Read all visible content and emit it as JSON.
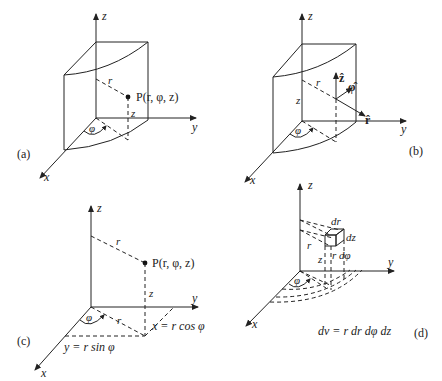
{
  "figure": {
    "panels": [
      {
        "id": "a",
        "label": "(a)",
        "axes": {
          "x": "x",
          "y": "y",
          "z": "z"
        },
        "point_label": "P(r, φ, z)",
        "r_label": "r",
        "z_label": "z",
        "phi_label": "φ"
      },
      {
        "id": "b",
        "label": "(b)",
        "axes": {
          "x": "x",
          "y": "y",
          "z": "z"
        },
        "r_label": "r",
        "z_label": "z",
        "phi_label": "φ",
        "unit_vectors": {
          "z_hat": "ẑ",
          "phi_hat": "φ̂",
          "r_hat": "r̂"
        }
      },
      {
        "id": "c",
        "label": "(c)",
        "axes": {
          "x": "x",
          "y": "y",
          "z": "z"
        },
        "point_label": "P(r, φ, z)",
        "r_label": "r",
        "r_base_label": "r",
        "z_label": "z",
        "phi_label": "φ",
        "x_eq": "x = r cos φ",
        "y_eq": "y = r sin φ"
      },
      {
        "id": "d",
        "label": "(d)",
        "axes": {
          "x": "x",
          "y": "y",
          "z": "z"
        },
        "r_label": "r",
        "z_label": "z",
        "phi_label": "φ",
        "dr_label": "dr",
        "dz_label": "dz",
        "rdphi_label": "r dφ",
        "volume_eq": "dv = r dr dφ dz"
      }
    ]
  }
}
